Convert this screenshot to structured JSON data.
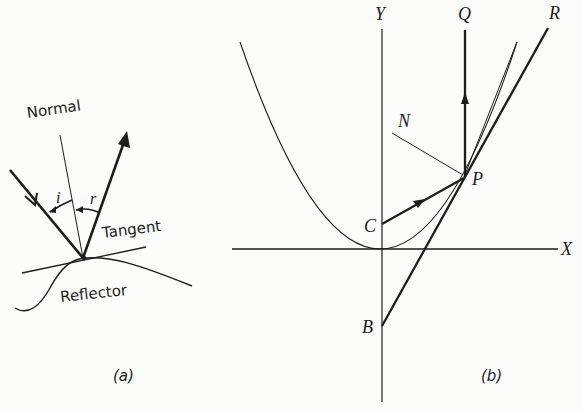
{
  "figure": {
    "panel_a": {
      "caption": "(a)",
      "labels": {
        "normal": "Normal",
        "incidence_angle": "i",
        "reflection_angle": "r",
        "tangent": "Tangent",
        "reflector": "Reflector"
      }
    },
    "panel_b": {
      "caption": "(b)",
      "labels": {
        "y_axis": "Y",
        "x_axis": "X",
        "q": "Q",
        "r": "R",
        "n": "N",
        "p": "P",
        "c": "C",
        "b": "B"
      }
    },
    "colors": {
      "ink": "#1d1d1d",
      "background": "#fbfbf9"
    }
  }
}
